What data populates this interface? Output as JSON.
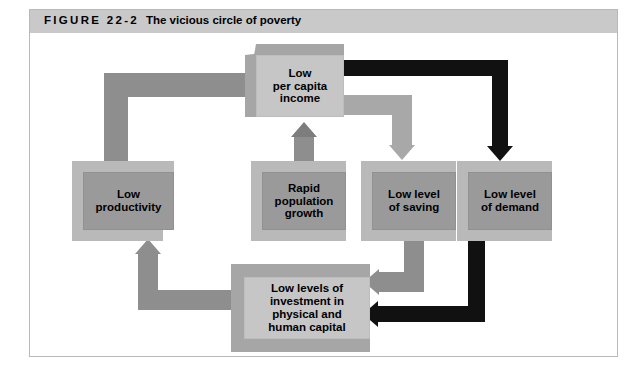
{
  "figure": {
    "number_label": "FIGURE 22-2",
    "title": "The vicious circle of poverty"
  },
  "colors": {
    "header_band": "#c9c9c9",
    "box_light": "#c6c6c6",
    "box_dark": "#9a9a9a",
    "arrow_gray": "#8e8e8e",
    "arrow_light_gray": "#a8a8a8",
    "arrow_black": "#111111",
    "frame_border": "#b9b9b9",
    "page_background": "#ffffff"
  },
  "diagram": {
    "type": "flowchart-cycle",
    "nodes": [
      {
        "id": "income",
        "label": "Low\nper capita\nincome",
        "lines": [
          "Low",
          "per capita",
          "income"
        ],
        "style": "light"
      },
      {
        "id": "productivity",
        "label": "Low\nproductivity",
        "lines": [
          "Low",
          "productivity"
        ],
        "style": "dark"
      },
      {
        "id": "population",
        "label": "Rapid\npopulation\ngrowth",
        "lines": [
          "Rapid",
          "population",
          "growth"
        ],
        "style": "dark"
      },
      {
        "id": "saving",
        "label": "Low level\nof saving",
        "lines": [
          "Low level",
          "of saving"
        ],
        "style": "dark"
      },
      {
        "id": "demand",
        "label": "Low level\nof demand",
        "lines": [
          "Low level",
          "of demand"
        ],
        "style": "dark"
      },
      {
        "id": "investment",
        "label": "Low levels of\ninvestment in\nphysical and\nhuman capital",
        "lines": [
          "Low levels of",
          "investment in",
          "physical and",
          "human capital"
        ],
        "style": "light"
      }
    ],
    "edges": [
      {
        "from": "productivity",
        "to": "income",
        "color": "gray",
        "route": "up-then-right"
      },
      {
        "from": "population",
        "to": "income",
        "color": "gray",
        "route": "up"
      },
      {
        "from": "income",
        "to": "saving",
        "color": "light-gray",
        "route": "right-then-down"
      },
      {
        "from": "income",
        "to": "demand",
        "color": "black",
        "route": "right-then-down"
      },
      {
        "from": "saving",
        "to": "investment",
        "color": "gray",
        "route": "down-then-left"
      },
      {
        "from": "demand",
        "to": "investment",
        "color": "black",
        "route": "down-then-left"
      },
      {
        "from": "investment",
        "to": "productivity",
        "color": "gray",
        "route": "left-then-up"
      }
    ]
  }
}
